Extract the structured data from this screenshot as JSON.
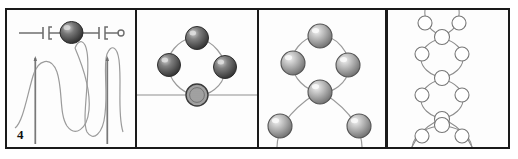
{
  "figure": {
    "number": "4",
    "type": "beadwork-instruction-diagram",
    "panel_count": 4,
    "style": {
      "background": "#ffffff",
      "frame_color": "#1a1a1a",
      "thread_color": "#8a8a8a",
      "bead_dark": "#3c3c3c",
      "bead_mid": "#9a9a9a",
      "bead_light": "#d8d8d8",
      "bead_outline": "#6f6f6f",
      "needle_color": "#777777"
    },
    "panels": [
      {
        "index": 1,
        "name": "panel-needles-and-thread",
        "description": "Thread looped around two vertical needles with a dark bead strung on a horizontal thread above",
        "elements": {
          "top_thread_label": "horizontal strung thread",
          "bead_count": 1,
          "needle_count": 2,
          "loop_count": 3,
          "bead_shade": "dark"
        }
      },
      {
        "index": 2,
        "name": "panel-four-bead-ring",
        "description": "Four beads joined into a ring sitting on a horizontal thread line; bottom bead is hatched",
        "elements": {
          "bead_count": 4,
          "ring_beads": [
            "top",
            "left",
            "right",
            "bottom-hatched"
          ],
          "baseline_label": "horizontal thread",
          "bead_shade": "dark"
        }
      },
      {
        "index": 3,
        "name": "panel-ring-with-picots",
        "description": "Four-bead ring above a shared bead, with two further beads on arched threads below",
        "elements": {
          "bead_count": 6,
          "ring_beads": [
            "top",
            "left",
            "right",
            "bottom-shared"
          ],
          "lower_beads": [
            "left-picot",
            "right-picot"
          ],
          "bead_shade": "light"
        }
      },
      {
        "index": 4,
        "name": "panel-completed-chain",
        "description": "Finished vertical chain of linked bead rings drawn as plain outline circles",
        "elements": {
          "bead_count": 13,
          "ring_count": 4,
          "bead_shade": "outline",
          "loop_at_bottom": true
        }
      }
    ]
  }
}
